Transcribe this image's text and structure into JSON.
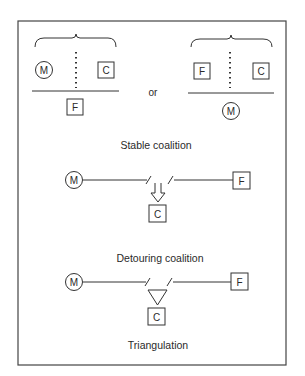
{
  "figure": {
    "stable": {
      "left": {
        "circle": "M",
        "box_right": "C",
        "below": "F"
      },
      "connector": "or",
      "right": {
        "box_left": "F",
        "box_right": "C",
        "below": "M"
      },
      "caption": "Stable coalition"
    },
    "detouring": {
      "left": "M",
      "right": "F",
      "target": "C",
      "caption": "Detouring coalition"
    },
    "triangulation": {
      "left": "M",
      "right": "F",
      "target": "C",
      "caption": "Triangulation"
    }
  },
  "colors": {
    "stroke": "#333333",
    "background": "#ffffff"
  }
}
